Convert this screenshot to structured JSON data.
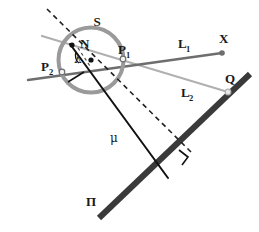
{
  "figure": {
    "background_color": "#ffffff",
    "colors": {
      "sphere_outline": "#9a9a9a",
      "line_L1": "#6e6e6e",
      "line_L2": "#b0b0b0",
      "plane": "#3a3a3a",
      "mu_line": "#111111",
      "dashed_line": "#222222",
      "label_text": "#1a1a1a",
      "point_fill_dark": "#111111",
      "point_fill_light": "#f2f2f2"
    },
    "labels": {
      "sphere": "S",
      "point_N": "N",
      "point_P1": "P",
      "point_P1_sub": "1",
      "point_P2": "P",
      "point_P2_sub": "2",
      "line_L1": "L",
      "line_L1_sub": "1",
      "line_L2": "L",
      "line_L2_sub": "2",
      "point_X": "X",
      "point_Q": "Q",
      "angle_lambda": "λ",
      "segment_mu": "μ",
      "plane_pi": "Π"
    },
    "geometry": {
      "sphere": {
        "cx": 91,
        "cy": 60,
        "r": 32.5,
        "stroke_width": 4
      },
      "points": {
        "N": {
          "x": 72,
          "y": 45
        },
        "P1": {
          "x": 123,
          "y": 59
        },
        "P2": {
          "x": 62,
          "y": 72
        },
        "X": {
          "x": 222,
          "y": 53
        },
        "Q": {
          "x": 228,
          "y": 92
        },
        "center": {
          "x": 91,
          "y": 60
        },
        "foot": {
          "x": 168,
          "y": 178
        }
      },
      "line_L1": {
        "x1": 28,
        "y1": 80,
        "x2": 222,
        "y2": 53
      },
      "line_L2": {
        "x1": 42,
        "y1": 36,
        "x2": 228,
        "y2": 92
      },
      "plane_pi": {
        "x1": 99,
        "y1": 218,
        "x2": 250,
        "y2": 74,
        "stroke_width": 6
      },
      "mu_line": {
        "x1": 70,
        "y1": 44,
        "x2": 168,
        "y2": 178
      },
      "dashed_line": {
        "x1": 47,
        "y1": 9,
        "x2": 191,
        "y2": 152
      }
    },
    "label_positions": {
      "S": {
        "x": 97,
        "y": 26
      },
      "N": {
        "x": 80,
        "y": 48
      },
      "P1": {
        "x": 118,
        "y": 54
      },
      "P2": {
        "x": 41,
        "y": 71
      },
      "L1": {
        "x": 178,
        "y": 48
      },
      "L2": {
        "x": 181,
        "y": 97
      },
      "X": {
        "x": 222,
        "y": 43
      },
      "Q": {
        "x": 228,
        "y": 83
      },
      "lambda": {
        "x": 74,
        "y": 62
      },
      "mu": {
        "x": 113,
        "y": 141
      },
      "Pi": {
        "x": 86,
        "y": 205
      }
    }
  }
}
